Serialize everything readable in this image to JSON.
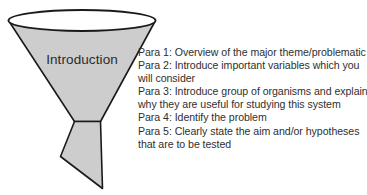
{
  "figure": {
    "name": "introduction-funnel-diagram",
    "shape_label": "Introduction",
    "fill_color": "#cdcdcd",
    "outline_color": "#1a1a1a",
    "top_ellipse_fill": "#ffffff",
    "background_color": "#ffffff"
  },
  "notes": {
    "text_color": "#2f2f2f",
    "lines": [
      "Para 1: Overview of the major theme/problematic",
      "Para 2: Introduce important variables which you",
      "will consider",
      "Para 3: Introduce group of organisms and explain",
      "why they are useful for studying this system",
      "Para 4: Identify the problem",
      "Para 5: Clearly state the aim and/or hypotheses",
      "that are to be tested"
    ]
  }
}
